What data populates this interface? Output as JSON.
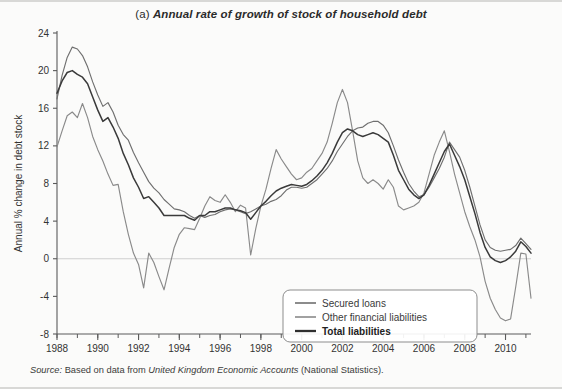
{
  "figure": {
    "panel_label": "(a)",
    "title": "Annual rate of growth of stock of household debt",
    "source_prefix": "Source:",
    "source_mid": " Based on data from ",
    "source_italic": "United Kingdom Economic Accounts",
    "source_suffix": " (National Statistics)."
  },
  "colors": {
    "secured": "#6f6f6f",
    "other": "#8a8a8a",
    "total": "#3a3a3a",
    "axis": "#5a5a5a",
    "zero_line": "#cfcfcf",
    "background": "#fbfbfa"
  },
  "chart_data": {
    "type": "line",
    "xlabel": "",
    "ylabel": "Annual % change in debt stock",
    "xlim": [
      1988,
      2011.25
    ],
    "ylim": [
      -8,
      24
    ],
    "yticks": [
      24,
      20,
      16,
      12,
      8,
      4,
      0,
      -4,
      -8
    ],
    "ytick_labels": [
      "24",
      "20",
      "16",
      "12",
      "8",
      "4",
      "0",
      "-4",
      "-8"
    ],
    "xticks": [
      1988,
      1990,
      1992,
      1994,
      1996,
      1998,
      2000,
      2002,
      2004,
      2006,
      2008,
      2010
    ],
    "xtick_labels": [
      "1988",
      "1990",
      "1992",
      "1994",
      "1996",
      "1998",
      "2000",
      "2002",
      "2004",
      "2006",
      "2008",
      "2010"
    ],
    "x_minor_tick_interval": 1,
    "grid": false,
    "zero_reference_line": 0,
    "legend_position": "bottom-right",
    "legend_entries": [
      "Secured loans",
      "Other financial liabilities",
      "Total liabilities"
    ],
    "x": [
      1988.0,
      1988.25,
      1988.5,
      1988.75,
      1989.0,
      1989.25,
      1989.5,
      1989.75,
      1990.0,
      1990.25,
      1990.5,
      1990.75,
      1991.0,
      1991.25,
      1991.5,
      1991.75,
      1992.0,
      1992.25,
      1992.5,
      1992.75,
      1993.0,
      1993.25,
      1993.5,
      1993.75,
      1994.0,
      1994.25,
      1994.5,
      1994.75,
      1995.0,
      1995.25,
      1995.5,
      1995.75,
      1996.0,
      1996.25,
      1996.5,
      1996.75,
      1997.0,
      1997.25,
      1997.5,
      1997.75,
      1998.0,
      1998.25,
      1998.5,
      1998.75,
      1999.0,
      1999.25,
      1999.5,
      1999.75,
      2000.0,
      2000.25,
      2000.5,
      2000.75,
      2001.0,
      2001.25,
      2001.5,
      2001.75,
      2002.0,
      2002.25,
      2002.5,
      2002.75,
      2003.0,
      2003.25,
      2003.5,
      2003.75,
      2004.0,
      2004.25,
      2004.5,
      2004.75,
      2005.0,
      2005.25,
      2005.5,
      2005.75,
      2006.0,
      2006.25,
      2006.5,
      2006.75,
      2007.0,
      2007.25,
      2007.5,
      2007.75,
      2008.0,
      2008.25,
      2008.5,
      2008.75,
      2009.0,
      2009.25,
      2009.5,
      2009.75,
      2010.0,
      2010.25,
      2010.5,
      2010.75,
      2011.0,
      2011.25
    ],
    "series": [
      {
        "name": "Secured loans",
        "color": "#6f6f6f",
        "values": [
          17.0,
          19.5,
          21.4,
          22.5,
          22.3,
          21.6,
          20.4,
          18.8,
          17.4,
          16.2,
          16.6,
          15.6,
          14.2,
          13.2,
          12.6,
          11.3,
          10.2,
          9.2,
          8.2,
          7.5,
          7.0,
          6.3,
          5.8,
          5.3,
          5.2,
          5.0,
          4.6,
          4.3,
          4.6,
          4.4,
          4.6,
          4.7,
          5.0,
          5.2,
          5.3,
          5.2,
          5.0,
          4.8,
          5.0,
          5.3,
          5.6,
          5.8,
          6.1,
          6.3,
          6.7,
          7.3,
          7.6,
          7.6,
          7.5,
          7.6,
          8.0,
          8.4,
          9.0,
          9.6,
          10.4,
          11.4,
          12.2,
          13.0,
          13.6,
          13.9,
          14.0,
          14.4,
          14.6,
          14.6,
          14.2,
          13.4,
          12.0,
          10.5,
          9.2,
          8.0,
          7.2,
          6.6,
          6.8,
          7.6,
          8.6,
          9.6,
          10.8,
          12.4,
          11.6,
          10.8,
          9.4,
          7.6,
          5.6,
          3.6,
          2.0,
          1.2,
          0.9,
          0.8,
          0.9,
          1.0,
          1.4,
          2.2,
          1.6,
          1.0
        ]
      },
      {
        "name": "Other financial liabilities",
        "color": "#8a8a8a",
        "values": [
          11.9,
          13.6,
          15.2,
          15.6,
          15.0,
          16.5,
          15.0,
          13.0,
          11.6,
          10.4,
          9.0,
          7.8,
          7.9,
          5.0,
          2.6,
          0.6,
          -0.6,
          -3.1,
          0.6,
          -0.4,
          -1.9,
          -3.3,
          -1.0,
          1.2,
          2.6,
          3.3,
          3.2,
          3.1,
          4.3,
          5.6,
          6.6,
          6.2,
          6.0,
          6.8,
          6.0,
          5.0,
          5.7,
          5.4,
          0.4,
          3.2,
          5.6,
          7.4,
          9.6,
          11.6,
          10.6,
          9.8,
          9.0,
          8.4,
          8.6,
          9.2,
          9.6,
          10.4,
          11.2,
          12.4,
          14.4,
          16.6,
          18.0,
          16.6,
          13.6,
          10.4,
          8.6,
          8.0,
          8.4,
          8.0,
          7.4,
          8.4,
          7.6,
          5.6,
          5.2,
          5.4,
          5.6,
          6.0,
          7.0,
          9.0,
          11.0,
          12.4,
          13.6,
          11.4,
          9.0,
          7.0,
          5.0,
          3.4,
          2.0,
          0.2,
          -2.4,
          -4.2,
          -5.4,
          -6.3,
          -6.6,
          -6.4,
          -3.0,
          0.6,
          0.5,
          -4.2
        ]
      },
      {
        "name": "Total liabilities",
        "color": "#3a3a3a",
        "values": [
          17.6,
          18.9,
          19.8,
          20.0,
          19.6,
          19.3,
          18.6,
          17.2,
          15.8,
          14.6,
          15.0,
          14.0,
          12.8,
          11.2,
          10.0,
          8.6,
          7.6,
          6.4,
          6.6,
          6.0,
          5.4,
          4.6,
          4.6,
          4.6,
          4.6,
          4.6,
          4.3,
          4.1,
          4.6,
          4.6,
          5.0,
          5.0,
          5.2,
          5.4,
          5.4,
          5.2,
          5.1,
          4.9,
          4.2,
          4.9,
          5.6,
          6.1,
          6.7,
          7.2,
          7.5,
          7.7,
          7.9,
          7.8,
          7.7,
          7.9,
          8.3,
          8.8,
          9.4,
          10.2,
          11.2,
          12.4,
          13.4,
          13.8,
          13.6,
          13.2,
          13.0,
          13.2,
          13.4,
          13.2,
          12.8,
          12.4,
          11.0,
          9.4,
          8.4,
          7.4,
          6.8,
          6.4,
          6.8,
          7.8,
          9.0,
          10.2,
          11.4,
          12.2,
          11.0,
          9.8,
          8.4,
          6.6,
          4.8,
          2.8,
          1.2,
          0.2,
          -0.2,
          -0.4,
          -0.2,
          0.2,
          0.8,
          1.8,
          1.3,
          0.6
        ]
      }
    ]
  }
}
